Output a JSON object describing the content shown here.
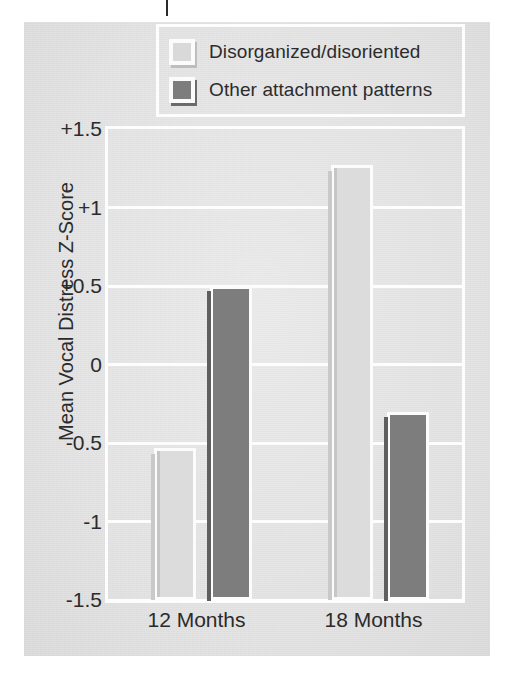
{
  "figure": {
    "legend": {
      "entries": [
        {
          "label": "Disorganized/disoriented",
          "swatch": "light-grey-square-icon",
          "color": "#dcdcdc"
        },
        {
          "label": "Other attachment patterns",
          "swatch": "dark-grey-square-icon",
          "color": "#7d7d7d"
        }
      ]
    },
    "colors": {
      "plate_background": "#e6e6e6",
      "gridline": "#fdfdfd",
      "series_light": "#dcdcdc",
      "series_dark": "#7d7d7d",
      "text": "#2b2b2b"
    }
  },
  "chart_data": {
    "type": "bar",
    "title": "",
    "xlabel": "",
    "ylabel": "Mean Vocal Distress Z-Score",
    "categories": [
      "12 Months",
      "18 Months"
    ],
    "series": [
      {
        "name": "Disorganized/disoriented",
        "color": "#dcdcdc",
        "values": [
          -0.53,
          1.27
        ]
      },
      {
        "name": "Other attachment patterns",
        "color": "#7d7d7d",
        "values": [
          0.5,
          -0.3
        ]
      }
    ],
    "ylim": [
      -1.5,
      1.5
    ],
    "yticks": [
      1.5,
      1,
      0.5,
      0,
      -0.5,
      -1,
      -1.5
    ],
    "ytick_labels": [
      "+1.5",
      "+1",
      "+0.5",
      "0",
      "-0.5",
      "-1",
      "-1.5"
    ],
    "grid": true,
    "legend_position": "top-center",
    "baseline": -1.5,
    "orientation": "vertical"
  }
}
